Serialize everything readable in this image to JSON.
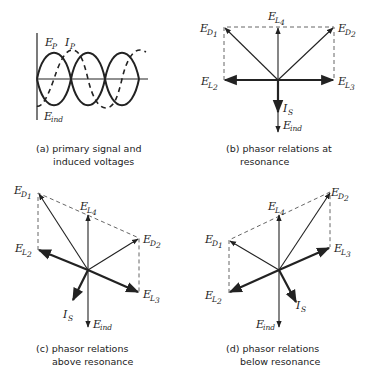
{
  "panels": {
    "a": {
      "caption_line1": "(a) primary signal and",
      "caption_line2": "induced voltages",
      "labels": {
        "ep_main": "E",
        "ep_sub": "P",
        "ip_main": "I",
        "ip_sub": "P",
        "eind_main": "E",
        "eind_sub": "ind"
      }
    },
    "b": {
      "caption_line1": "(b) phasor relations at",
      "caption_line2": "resonance"
    },
    "c": {
      "caption_line1": "(c) phasor relations",
      "caption_line2": "above resonance"
    },
    "d": {
      "caption_line1": "(d) phasor relations",
      "caption_line2": "below resonance"
    }
  },
  "phasor_labels": {
    "ed1_main": "E",
    "ed1_sub": "D",
    "ed1_idx": "1",
    "ed2_main": "E",
    "ed2_sub": "D",
    "ed2_idx": "2",
    "el2_main": "E",
    "el2_sub": "L",
    "el2_idx": "2",
    "el3_main": "E",
    "el3_sub": "L",
    "el3_idx": "3",
    "el4_main": "E",
    "el4_sub": "L",
    "el4_idx": "4",
    "is_main": "I",
    "is_sub": "S",
    "eind_main": "E",
    "eind_sub": "ind"
  },
  "colors": {
    "ink": "#222222",
    "background": "#ffffff"
  }
}
